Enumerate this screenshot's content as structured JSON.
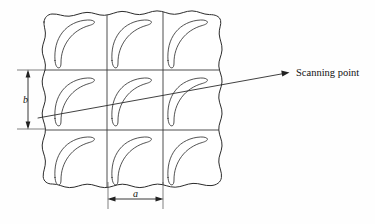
{
  "figure": {
    "name": "scanning-point-grid-diagram",
    "type": "technical-line-diagram",
    "background_color": "#fefefe",
    "ink_color": "#2b2b2b",
    "labels": {
      "scanning_point": "Scanning point",
      "pitch_horizontal": "a",
      "pitch_vertical": "b"
    },
    "grid": {
      "rows": 3,
      "columns": 3,
      "cell_count": 9,
      "left": 42,
      "top": 14,
      "right": 221,
      "bottom": 186,
      "vertical_divider_x": [
        107,
        163
      ],
      "horizontal_divider_y": [
        70,
        130
      ],
      "outer_edge_style": "torn-wavy"
    },
    "blade": {
      "name": "curved-blade-crescent",
      "count_per_cell": 1,
      "orientation": "concave-left-tip-down"
    },
    "dimension_a": {
      "label": "a",
      "orientation": "horizontal",
      "from_x": 108,
      "to_x": 163,
      "y": 199,
      "arrowheads": "both"
    },
    "dimension_b": {
      "label": "b",
      "orientation": "vertical",
      "from_y": 70,
      "to_y": 129,
      "x": 28,
      "arrowheads": "both"
    },
    "scanning_line": {
      "name": "scan-trace-line",
      "start_x": 38,
      "start_y": 118,
      "end_x": 288,
      "end_y": 73,
      "arrowhead_at": "end"
    }
  }
}
